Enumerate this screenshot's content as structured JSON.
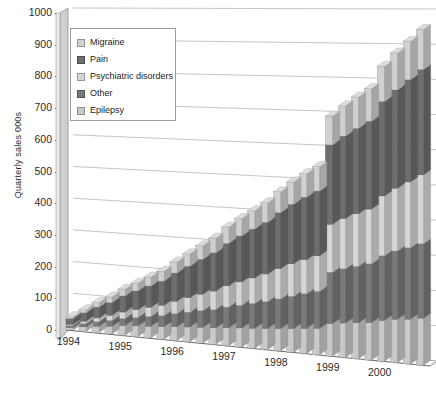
{
  "chart_data": {
    "type": "bar",
    "subtype": "3d-stacked-column",
    "title": "",
    "xlabel": "",
    "ylabel": "Quarterly sales 000s",
    "ylim": [
      0,
      1000
    ],
    "ytick_step": 100,
    "ytick_labels": [
      "0",
      "100",
      "200",
      "300",
      "400",
      "500",
      "600",
      "700",
      "800",
      "900",
      "1000"
    ],
    "grid": true,
    "legend_position": "top-left-inside",
    "categories": [
      "1994 Q1",
      "1994 Q2",
      "1994 Q3",
      "1994 Q4",
      "1995 Q1",
      "1995 Q2",
      "1995 Q3",
      "1995 Q4",
      "1996 Q1",
      "1996 Q2",
      "1996 Q3",
      "1996 Q4",
      "1997 Q1",
      "1997 Q2",
      "1997 Q3",
      "1997 Q4",
      "1998 Q1",
      "1998 Q2",
      "1998 Q3",
      "1998 Q4",
      "1999 Q1",
      "1999 Q2",
      "1999 Q3",
      "1999 Q4",
      "2000 Q1",
      "2000 Q2",
      "2000 Q3",
      "2000 Q4"
    ],
    "x_axis_group_labels": [
      "1994",
      "1995",
      "1996",
      "1997",
      "1998",
      "1999",
      "2000"
    ],
    "series": [
      {
        "name": "Epilepsy",
        "color": "#c9c9c9",
        "values": [
          8,
          14,
          20,
          24,
          30,
          33,
          36,
          38,
          42,
          45,
          48,
          50,
          54,
          57,
          60,
          63,
          66,
          70,
          74,
          78,
          95,
          100,
          104,
          108,
          118,
          124,
          128,
          134
        ]
      },
      {
        "name": "Other",
        "color": "#7a7a7a",
        "values": [
          6,
          10,
          14,
          18,
          22,
          26,
          30,
          34,
          40,
          45,
          50,
          55,
          62,
          68,
          74,
          80,
          88,
          95,
          102,
          108,
          150,
          158,
          164,
          170,
          186,
          196,
          204,
          212
        ]
      },
      {
        "name": "Psychiatric disorders",
        "color": "#d6d6d6",
        "values": [
          4,
          8,
          12,
          16,
          20,
          24,
          28,
          32,
          38,
          44,
          50,
          56,
          64,
          70,
          76,
          82,
          90,
          96,
          100,
          104,
          140,
          146,
          152,
          158,
          172,
          180,
          188,
          196
        ]
      },
      {
        "name": "Pain",
        "color": "#6e6e6e",
        "values": [
          18,
          26,
          34,
          40,
          50,
          58,
          66,
          74,
          86,
          96,
          106,
          116,
          128,
          138,
          146,
          154,
          166,
          176,
          184,
          190,
          232,
          240,
          248,
          254,
          272,
          282,
          292,
          300
        ]
      },
      {
        "name": "Migraine",
        "color": "#d0d0d0",
        "values": [
          6,
          10,
          14,
          17,
          21,
          24,
          27,
          30,
          34,
          38,
          41,
          44,
          49,
          52,
          55,
          58,
          62,
          66,
          69,
          72,
          84,
          88,
          91,
          94,
          101,
          106,
          110,
          114
        ]
      }
    ],
    "totals": [
      42,
      68,
      94,
      115,
      143,
      165,
      187,
      208,
      240,
      268,
      295,
      321,
      357,
      385,
      411,
      437,
      472,
      503,
      529,
      552,
      701,
      732,
      759,
      784,
      849,
      888,
      922,
      956
    ]
  },
  "legend": {
    "items": [
      {
        "label": "Migraine",
        "color": "#d0d0d0"
      },
      {
        "label": "Pain",
        "color": "#6e6e6e"
      },
      {
        "label": "Psychiatric disorders",
        "color": "#d6d6d6"
      },
      {
        "label": "Other",
        "color": "#7a7a7a"
      },
      {
        "label": "Epilepsy",
        "color": "#c9c9c9"
      }
    ]
  },
  "axes": {
    "y_title": "Quarterly sales 000s",
    "y_labels": [
      "1000",
      "900",
      "800",
      "700",
      "600",
      "500",
      "400",
      "300",
      "200",
      "100",
      "0"
    ],
    "x_labels": [
      "1994",
      "1995",
      "1996",
      "1997",
      "1998",
      "1999",
      "2000"
    ]
  },
  "colors": {
    "grid": "#9a9a9a",
    "axis": "#555555",
    "wall_face": "#cfcfcf",
    "wall_side": "#e6e6e6",
    "text": "#2b2b2b",
    "legend_border": "#9b9b9b",
    "background": "#ffffff"
  }
}
